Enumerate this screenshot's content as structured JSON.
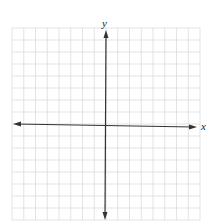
{
  "graph": {
    "type": "coordinate-plane",
    "x_axis_label": "x",
    "y_axis_label": "y",
    "grid": {
      "columns": 16,
      "rows": 16,
      "left": 12,
      "top": 28,
      "right": 200,
      "bottom": 220,
      "line_color": "#dcdcdc"
    },
    "axes": {
      "origin_px": [
        105,
        125
      ],
      "color": "#333333",
      "x_axis_arrows": "both",
      "y_axis_arrows": "both"
    }
  }
}
